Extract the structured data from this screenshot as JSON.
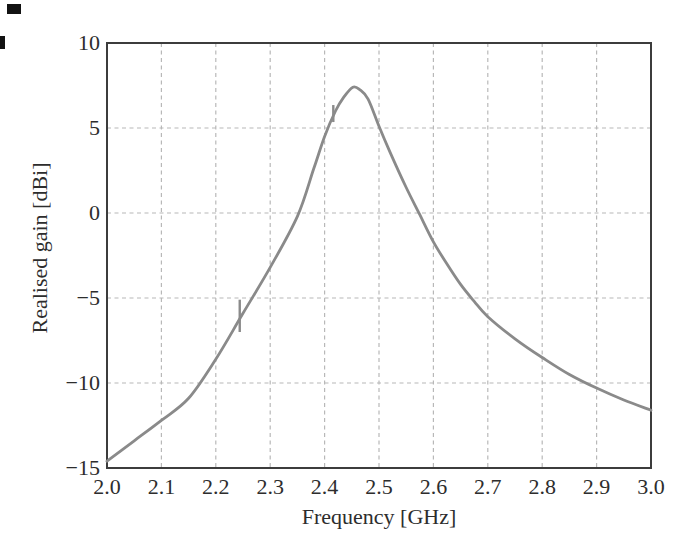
{
  "chart_data": {
    "type": "line",
    "title": "",
    "xlabel": "Frequency [GHz]",
    "ylabel": "Realised gain [dBi]",
    "xlim": [
      2.0,
      3.0
    ],
    "ylim": [
      -15,
      10
    ],
    "grid": "dashed",
    "legend": "none",
    "x_ticks": {
      "values": [
        2.0,
        2.1,
        2.2,
        2.3,
        2.4,
        2.5,
        2.6,
        2.7,
        2.8,
        2.9,
        3.0
      ],
      "labels": [
        "2.0",
        "2.1",
        "2.2",
        "2.3",
        "2.4",
        "2.5",
        "2.6",
        "2.7",
        "2.8",
        "2.9",
        "3.0"
      ]
    },
    "y_ticks": {
      "values": [
        10,
        5,
        0,
        -5,
        -10,
        -15
      ],
      "labels": [
        "10",
        "5",
        "0",
        "−5",
        "−10",
        "−15"
      ]
    },
    "x_gridlines": [
      2.1,
      2.2,
      2.3,
      2.4,
      2.5,
      2.6,
      2.7,
      2.8,
      2.9
    ],
    "y_gridlines": [
      5,
      0,
      -5,
      -10
    ],
    "series": [
      {
        "name": "realised-gain",
        "points": [
          [
            2.0,
            -14.6
          ],
          [
            2.05,
            -13.4
          ],
          [
            2.1,
            -12.2
          ],
          [
            2.15,
            -10.9
          ],
          [
            2.2,
            -8.6
          ],
          [
            2.25,
            -5.9
          ],
          [
            2.3,
            -3.2
          ],
          [
            2.35,
            -0.2
          ],
          [
            2.38,
            2.6
          ],
          [
            2.4,
            4.5
          ],
          [
            2.42,
            6.0
          ],
          [
            2.435,
            6.8
          ],
          [
            2.452,
            7.4
          ],
          [
            2.465,
            7.25
          ],
          [
            2.48,
            6.7
          ],
          [
            2.5,
            5.1
          ],
          [
            2.52,
            3.6
          ],
          [
            2.55,
            1.5
          ],
          [
            2.575,
            -0.1
          ],
          [
            2.6,
            -1.7
          ],
          [
            2.625,
            -3.0
          ],
          [
            2.65,
            -4.2
          ],
          [
            2.675,
            -5.2
          ],
          [
            2.7,
            -6.1
          ],
          [
            2.75,
            -7.4
          ],
          [
            2.8,
            -8.5
          ],
          [
            2.85,
            -9.5
          ],
          [
            2.9,
            -10.3
          ],
          [
            2.95,
            -11.0
          ],
          [
            3.0,
            -11.6
          ]
        ]
      }
    ],
    "markers": [
      {
        "f": 2.244,
        "g": -6.1,
        "bar_top": -5.1,
        "bar_bottom": -7.0
      },
      {
        "f": 2.416,
        "g": 5.8,
        "bar_top": 6.35,
        "bar_bottom": 5.35
      }
    ],
    "peak": {
      "f": 2.45,
      "g": 7.4
    },
    "colors": {
      "curve": "#8a8a8a",
      "marker": "#8a8a8a",
      "grid": "#b8b8b8",
      "frame": "#3c3c3c",
      "text": "#2d2d2d",
      "background": "#ffffff"
    }
  }
}
